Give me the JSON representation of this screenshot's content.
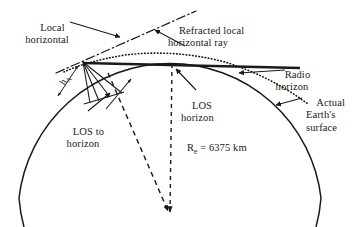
{
  "figure": {
    "background_color": "#ffffff",
    "ink_color": "#1a1a1a"
  },
  "labels": {
    "local_horizontal": "Local\nhorizontal",
    "refracted_ray": "Refracted local\nhorizontal ray",
    "radio_horizon": "Radio\nhorizon",
    "actual_earth_surface": "Actual\nEarth's\nsurface",
    "los_horizon": "LOS\nhorizon",
    "los_to_horizon": "LOS to\nhorizon",
    "antenna_height": "h",
    "antenna_height_sub": "A",
    "earth_radius_symbol": "R",
    "earth_radius_sub": "e",
    "earth_radius_value": " = 6375 km"
  },
  "geometry": {
    "antenna_point": {
      "x": 83,
      "y": 62
    },
    "earth_center": {
      "x": 170,
      "y": 210
    },
    "earth_radius_px": 152,
    "los_tangent_point": {
      "x": 172,
      "y": 64
    },
    "vertical_radius_x": 172,
    "local_horizontal_endpoint": {
      "x": 196,
      "y": 11
    }
  },
  "line_styles": {
    "earth_surface": "solid",
    "local_horizontal": "dash-dot",
    "refracted_ray": "dotted",
    "los_ray": "solid-thick",
    "earth_radius": "dashed",
    "los_to_horizon_radius": "dashed"
  }
}
